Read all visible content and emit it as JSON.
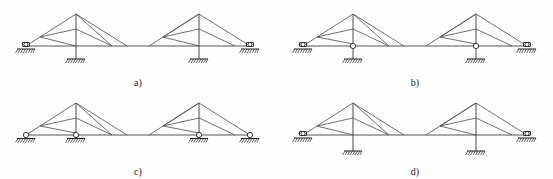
{
  "figure": {
    "panels": [
      {
        "id": "a",
        "label": "a)",
        "description": "Two pitched trusses; outer ends on roller supports, inner ends on short posts to fixed ground pads, rigid bottom-chord joint",
        "left_truss": {
          "outer_support": "roller",
          "inner_support": "fixed-post",
          "inner_joint": "rigid"
        },
        "right_truss": {
          "outer_support": "roller",
          "inner_support": "fixed-post",
          "inner_joint": "rigid"
        }
      },
      {
        "id": "b",
        "label": "b)",
        "description": "Two pitched trusses; outer ends on roller supports, inner ends on posts with pin hinge at bottom chord to fixed ground pads",
        "left_truss": {
          "outer_support": "roller",
          "inner_support": "fixed-post",
          "inner_joint": "hinge"
        },
        "right_truss": {
          "outer_support": "roller",
          "inner_support": "fixed-post",
          "inner_joint": "hinge"
        }
      },
      {
        "id": "c",
        "label": "c)",
        "description": "Two pitched trusses; all four bearing points are roller supports directly beneath the bottom chord",
        "left_truss": {
          "outer_support": "roller",
          "inner_support": "roller",
          "inner_joint": "roller"
        },
        "right_truss": {
          "outer_support": "roller",
          "inner_support": "roller",
          "inner_joint": "roller"
        }
      },
      {
        "id": "d",
        "label": "d)",
        "description": "Two pitched trusses; outer ends on roller supports, continuous vertical columns through bottom chord down to fixed ground pads",
        "left_truss": {
          "outer_support": "roller",
          "inner_support": "column",
          "inner_joint": "continuous"
        },
        "right_truss": {
          "outer_support": "roller",
          "inner_support": "column",
          "inner_joint": "continuous"
        }
      }
    ],
    "colors": {
      "background": "#fefefe",
      "member_line": "#4a4a4a",
      "chord_line": "#555555",
      "support_line": "#1f1f1f",
      "label_text": "#1a1a1a"
    }
  }
}
